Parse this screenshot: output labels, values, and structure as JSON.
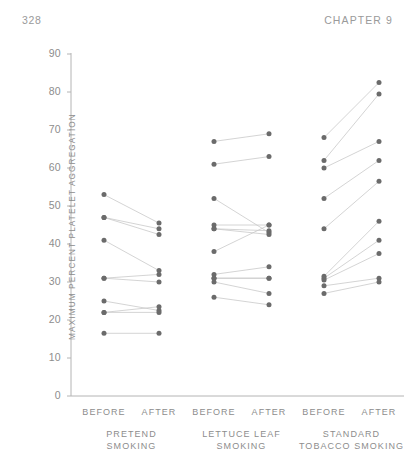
{
  "header": {
    "page_number": "328",
    "chapter_label": "CHAPTER 9"
  },
  "chart_data": {
    "type": "scatter",
    "title": "",
    "xlabel": "",
    "ylabel": "MAXIMUM PERCENT PLATELET AGGREGATION",
    "ylim": [
      0,
      90
    ],
    "ytick_labels": [
      "0",
      "10",
      "20",
      "30",
      "40",
      "50",
      "60",
      "70",
      "80",
      "90"
    ],
    "ytick_values": [
      0,
      10,
      20,
      30,
      40,
      50,
      60,
      70,
      80,
      90
    ],
    "grid": false,
    "legend": false,
    "condition_labels": [
      "BEFORE",
      "AFTER"
    ],
    "groups": [
      {
        "name": "PRETEND SMOKING",
        "name_line1": "PRETEND",
        "name_line2": "SMOKING",
        "pairs": [
          {
            "before": 53,
            "after": 45.5
          },
          {
            "before": 47,
            "after": 44
          },
          {
            "before": 47,
            "after": 42.5
          },
          {
            "before": 41,
            "after": 33
          },
          {
            "before": 31,
            "after": 32
          },
          {
            "before": 31,
            "after": 30
          },
          {
            "before": 25,
            "after": 22.5
          },
          {
            "before": 22,
            "after": 23.5
          },
          {
            "before": 22,
            "after": 22
          },
          {
            "before": 16.5,
            "after": 16.5
          }
        ]
      },
      {
        "name": "LETTUCE LEAF SMOKING",
        "name_line1": "LETTUCE LEAF",
        "name_line2": "SMOKING",
        "pairs": [
          {
            "before": 67,
            "after": 69
          },
          {
            "before": 61,
            "after": 63
          },
          {
            "before": 52,
            "after": 43
          },
          {
            "before": 45,
            "after": 45
          },
          {
            "before": 44,
            "after": 43.5
          },
          {
            "before": 44,
            "after": 42.5
          },
          {
            "before": 38,
            "after": 45
          },
          {
            "before": 32,
            "after": 34
          },
          {
            "before": 31,
            "after": 31
          },
          {
            "before": 31,
            "after": 31
          },
          {
            "before": 30,
            "after": 27
          },
          {
            "before": 26,
            "after": 24
          }
        ]
      },
      {
        "name": "STANDARD TOBACCO SMOKING",
        "name_line1": "STANDARD",
        "name_line2": "TOBACCO SMOKING",
        "pairs": [
          {
            "before": 68,
            "after": 82.5
          },
          {
            "before": 62,
            "after": 79.5
          },
          {
            "before": 60,
            "after": 67
          },
          {
            "before": 52,
            "after": 62
          },
          {
            "before": 44,
            "after": 56.5
          },
          {
            "before": 31.5,
            "after": 46
          },
          {
            "before": 31,
            "after": 41
          },
          {
            "before": 30.5,
            "after": 37.5
          },
          {
            "before": 29,
            "after": 31
          },
          {
            "before": 27,
            "after": 30
          }
        ]
      }
    ]
  }
}
